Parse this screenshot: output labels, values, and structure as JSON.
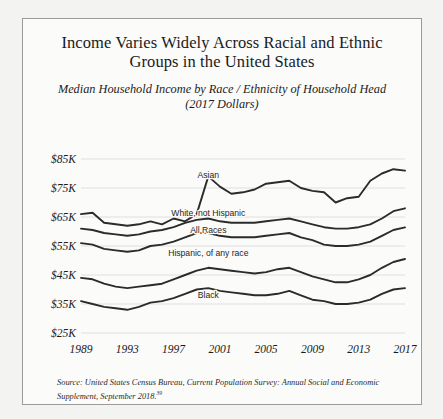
{
  "figure": {
    "title": "Income Varies Widely Across Racial and Ethnic Groups in the United States",
    "subtitle_line1": "Median Household Income by Race / Ethnicity of Household Head",
    "subtitle_line2": "(2017 Dollars)",
    "source": "Source: United States Census Bureau, Current Population Survey: Annual Social and Economic Supplement, September 2018.",
    "source_footnote_marker": "39",
    "border_color": "#9a9a9a",
    "background_color": "#fbfbfa",
    "line_color": "#2b2b2b",
    "grid_color": "#d9d9d9"
  },
  "chart_data": {
    "type": "line",
    "title": "Income Varies Widely Across Racial and Ethnic Groups in the United States",
    "subtitle": "Median Household Income by Race / Ethnicity of Household Head (2017 Dollars)",
    "xlabel": "",
    "ylabel": "",
    "grid": true,
    "legend": "inline-labels",
    "xlim": [
      1989,
      2017
    ],
    "ylim": [
      25000,
      85000
    ],
    "ytick_values": [
      85000,
      75000,
      65000,
      55000,
      45000,
      35000,
      25000
    ],
    "ytick_labels": [
      "$85K",
      "$75K",
      "$65K",
      "$55K",
      "$45K",
      "$35K",
      "$25K"
    ],
    "xtick_values": [
      1989,
      1993,
      1997,
      2001,
      2005,
      2009,
      2013,
      2017
    ],
    "xtick_labels": [
      "1989",
      "1993",
      "1997",
      "2001",
      "2005",
      "2009",
      "2013",
      "2017"
    ],
    "x": [
      1989,
      1990,
      1991,
      1992,
      1993,
      1994,
      1995,
      1996,
      1997,
      1998,
      1999,
      2000,
      2001,
      2002,
      2003,
      2004,
      2005,
      2006,
      2007,
      2008,
      2009,
      2010,
      2011,
      2012,
      2013,
      2014,
      2015,
      2016,
      2017
    ],
    "series": [
      {
        "name": "Asian",
        "label": "Asian",
        "label_x": 2000,
        "label_y": 78500,
        "values": [
          66000,
          66500,
          63000,
          62500,
          62000,
          62500,
          63500,
          62500,
          64500,
          63500,
          66000,
          79000,
          75500,
          73000,
          73500,
          74500,
          76500,
          77000,
          77500,
          75000,
          74000,
          73500,
          70000,
          71500,
          72000,
          77500,
          80000,
          81500,
          81000
        ]
      },
      {
        "name": "White, not Hispanic",
        "label": "White, not Hispanic",
        "label_x": 2000,
        "label_y": 65500,
        "values": [
          61000,
          60500,
          59500,
          59000,
          58500,
          59000,
          60000,
          60500,
          61500,
          63000,
          64000,
          64500,
          63500,
          63000,
          63000,
          63000,
          63500,
          64000,
          64500,
          63500,
          62500,
          61500,
          61000,
          61000,
          61500,
          62500,
          64500,
          67000,
          68000
        ]
      },
      {
        "name": "All Races",
        "label": "All Races",
        "label_x": 2000,
        "label_y": 59500,
        "values": [
          56000,
          55500,
          54000,
          53500,
          53000,
          53500,
          55000,
          55500,
          56500,
          58000,
          59500,
          59500,
          58500,
          58000,
          58000,
          58000,
          58500,
          59000,
          59500,
          58000,
          57000,
          55500,
          55000,
          55000,
          55500,
          56500,
          58500,
          60500,
          61400
        ]
      },
      {
        "name": "Hispanic, of any race",
        "label": "Hispanic, of any race",
        "label_x": 2000,
        "label_y": 51500,
        "values": [
          44000,
          43500,
          42000,
          41000,
          40500,
          41000,
          41500,
          42000,
          43500,
          45000,
          46500,
          47500,
          47000,
          46500,
          46000,
          45500,
          46000,
          47000,
          47500,
          46000,
          44500,
          43500,
          42500,
          42500,
          43500,
          45000,
          47500,
          49500,
          50500
        ]
      },
      {
        "name": "Black",
        "label": "Black",
        "label_x": 2000,
        "label_y": 37000,
        "values": [
          36000,
          35000,
          34000,
          33500,
          33000,
          34000,
          35500,
          36000,
          37000,
          38500,
          40000,
          40500,
          39500,
          39000,
          38500,
          38000,
          38000,
          38500,
          39500,
          38000,
          36500,
          36000,
          35000,
          35000,
          35500,
          36500,
          38500,
          40000,
          40500
        ]
      }
    ]
  }
}
